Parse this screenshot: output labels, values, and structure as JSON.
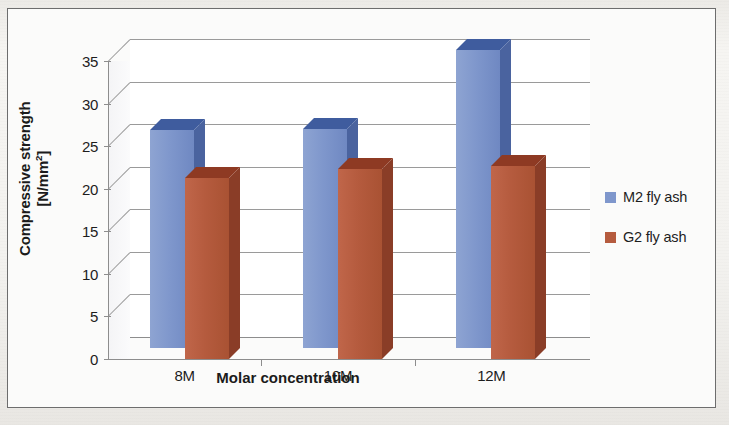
{
  "chart_data": {
    "type": "bar",
    "title": "",
    "subtitle": "",
    "categories": [
      "8M",
      "10M",
      "12M"
    ],
    "series": [
      {
        "name": "M2 fly ash",
        "color": "#7f97cc",
        "values": [
          25.6,
          25.7,
          35.0
        ]
      },
      {
        "name": "G2 fly ash",
        "color": "#b55b3e",
        "values": [
          21.2,
          22.3,
          22.7
        ]
      }
    ],
    "xlabel": "Molar concentration",
    "ylabel": "Compressive strength [N/mm2]",
    "ylabel_main": "Compressive strength",
    "ylabel_unit": "[N/mm",
    "ylabel_unit_sup": "2",
    "ylabel_unit_end": "]",
    "ylim": [
      0,
      35
    ],
    "ytick_step": 5,
    "yticks": [
      "35",
      "30",
      "25",
      "20",
      "15",
      "10",
      "5",
      "0"
    ],
    "ytick_values": [
      35,
      30,
      25,
      20,
      15,
      10,
      5,
      0
    ],
    "grid": true,
    "grid_axis": "y",
    "legend_position": "right",
    "style": "3d-clustered-column"
  },
  "legend": {
    "items": [
      {
        "label": "M2 fly ash",
        "color": "#7f97cc"
      },
      {
        "label": "G2 fly ash",
        "color": "#b55b3e"
      }
    ]
  },
  "colors": {
    "series_blue": "#7f97cc",
    "series_red": "#b55b3e",
    "gridline": "#9a9a9a",
    "axis": "#8d8d8d",
    "text": "#1d1d1d",
    "plot_background": "#ffffff",
    "page_background": "#f2f1ee"
  }
}
